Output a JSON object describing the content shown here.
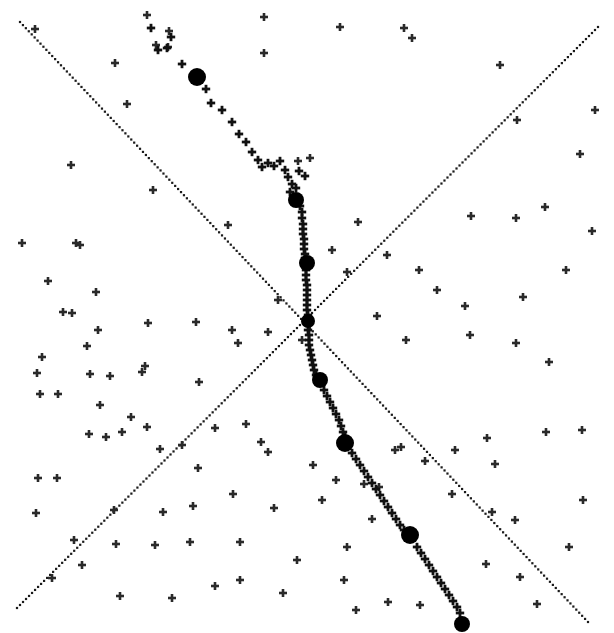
{
  "figure": {
    "title": "",
    "background_color": "#ffffff",
    "marker_color": "#111111",
    "line_color": "#1a1a1a",
    "width": 614,
    "height": 633
  },
  "chart_data": {
    "type": "scatter",
    "title": "",
    "xlabel": "",
    "ylabel": "",
    "xlim": [
      0,
      614
    ],
    "ylim": [
      0,
      633
    ],
    "grid": false,
    "legend": "none",
    "annotations": [],
    "tick_labels": {
      "x": [],
      "y": []
    },
    "origin": [
      308,
      321
    ],
    "series": [
      {
        "name": "crossing-line-nw-se",
        "type": "line",
        "style": "dotted",
        "marker": "square-dot",
        "x": [
          20,
          588
        ],
        "y": [
          22,
          622
        ]
      },
      {
        "name": "crossing-line-sw-ne",
        "type": "line",
        "style": "dotted",
        "marker": "square-dot",
        "x": [
          17,
          598
        ],
        "y": [
          608,
          27
        ]
      },
      {
        "name": "particle-track",
        "type": "scatter",
        "marker": "plus",
        "points": [
          [
            151,
            28
          ],
          [
            171,
            37
          ],
          [
            158,
            50
          ],
          [
            167,
            48
          ],
          [
            182,
            64
          ],
          [
            206,
            89
          ],
          [
            211,
            103
          ],
          [
            222,
            110
          ],
          [
            232,
            122
          ],
          [
            239,
            134
          ],
          [
            246,
            142
          ],
          [
            252,
            152
          ],
          [
            258,
            160
          ],
          [
            262,
            167
          ],
          [
            268,
            163
          ],
          [
            274,
            166
          ],
          [
            280,
            161
          ],
          [
            285,
            170
          ],
          [
            288,
            177
          ],
          [
            292,
            184
          ],
          [
            299,
            171
          ],
          [
            305,
            176
          ],
          [
            290,
            192
          ],
          [
            296,
            188
          ],
          [
            300,
            206
          ],
          [
            302,
            212
          ],
          [
            302,
            218
          ],
          [
            303,
            224
          ],
          [
            303,
            229
          ],
          [
            303,
            234
          ],
          [
            304,
            239
          ],
          [
            304,
            244
          ],
          [
            304,
            249
          ],
          [
            305,
            254
          ],
          [
            305,
            258
          ],
          [
            306,
            270
          ],
          [
            306,
            275
          ],
          [
            306,
            280
          ],
          [
            307,
            285
          ],
          [
            307,
            290
          ],
          [
            307,
            295
          ],
          [
            307,
            300
          ],
          [
            307,
            305
          ],
          [
            307,
            310
          ],
          [
            308,
            315
          ],
          [
            308,
            330
          ],
          [
            309,
            335
          ],
          [
            309,
            340
          ],
          [
            309,
            345
          ],
          [
            310,
            350
          ],
          [
            311,
            355
          ],
          [
            312,
            360
          ],
          [
            313,
            365
          ],
          [
            314,
            370
          ],
          [
            316,
            375
          ],
          [
            324,
            390
          ],
          [
            327,
            396
          ],
          [
            330,
            402
          ],
          [
            333,
            408
          ],
          [
            336,
            414
          ],
          [
            339,
            420
          ],
          [
            341,
            426
          ],
          [
            343,
            432
          ],
          [
            345,
            437
          ],
          [
            352,
            453
          ],
          [
            356,
            459
          ],
          [
            360,
            465
          ],
          [
            364,
            471
          ],
          [
            368,
            477
          ],
          [
            372,
            483
          ],
          [
            376,
            489
          ],
          [
            380,
            495
          ],
          [
            384,
            501
          ],
          [
            388,
            507
          ],
          [
            392,
            513
          ],
          [
            396,
            519
          ],
          [
            400,
            525
          ],
          [
            404,
            530
          ],
          [
            417,
            547
          ],
          [
            421,
            553
          ],
          [
            425,
            559
          ],
          [
            429,
            565
          ],
          [
            433,
            571
          ],
          [
            437,
            577
          ],
          [
            441,
            583
          ],
          [
            445,
            589
          ],
          [
            449,
            595
          ],
          [
            453,
            601
          ],
          [
            457,
            607
          ],
          [
            460,
            613
          ]
        ]
      },
      {
        "name": "track-bright-nodes",
        "type": "scatter",
        "marker": "filled-circle",
        "points": [
          [
            197,
            77,
            9
          ],
          [
            296,
            200,
            8
          ],
          [
            307,
            263,
            8
          ],
          [
            308,
            321,
            7
          ],
          [
            320,
            380,
            8
          ],
          [
            345,
            443,
            9
          ],
          [
            410,
            535,
            9
          ],
          [
            462,
            624,
            8
          ]
        ]
      },
      {
        "name": "background-field",
        "type": "scatter",
        "marker": "plus",
        "points": [
          [
            35,
            29
          ],
          [
            71,
            165
          ],
          [
            80,
            245
          ],
          [
            127,
            104
          ],
          [
            153,
            190
          ],
          [
            115,
            63
          ],
          [
            147,
            15
          ],
          [
            169,
            31
          ],
          [
            156,
            45
          ],
          [
            264,
            53
          ],
          [
            168,
            47
          ],
          [
            228,
            225
          ],
          [
            264,
            17
          ],
          [
            298,
            161
          ],
          [
            340,
            27
          ],
          [
            310,
            158
          ],
          [
            404,
            28
          ],
          [
            412,
            38
          ],
          [
            500,
            65
          ],
          [
            595,
            110
          ],
          [
            545,
            207
          ],
          [
            580,
            154
          ],
          [
            592,
            231
          ],
          [
            516,
            218
          ],
          [
            566,
            270
          ],
          [
            523,
            297
          ],
          [
            471,
            216
          ],
          [
            517,
            120
          ],
          [
            22,
            243
          ],
          [
            76,
            243
          ],
          [
            48,
            281
          ],
          [
            96,
            292
          ],
          [
            63,
            312
          ],
          [
            72,
            313
          ],
          [
            98,
            330
          ],
          [
            87,
            346
          ],
          [
            42,
            357
          ],
          [
            37,
            373
          ],
          [
            90,
            374
          ],
          [
            110,
            376
          ],
          [
            40,
            394
          ],
          [
            58,
            394
          ],
          [
            145,
            366
          ],
          [
            100,
            405
          ],
          [
            131,
            417
          ],
          [
            196,
            322
          ],
          [
            232,
            330
          ],
          [
            268,
            332
          ],
          [
            238,
            343
          ],
          [
            278,
            300
          ],
          [
            302,
            340
          ],
          [
            358,
            222
          ],
          [
            387,
            255
          ],
          [
            419,
            270
          ],
          [
            437,
            290
          ],
          [
            465,
            306
          ],
          [
            332,
            250
          ],
          [
            347,
            272
          ],
          [
            377,
            316
          ],
          [
            406,
            340
          ],
          [
            470,
            335
          ],
          [
            516,
            343
          ],
          [
            549,
            362
          ],
          [
            122,
            432
          ],
          [
            147,
            427
          ],
          [
            160,
            449
          ],
          [
            182,
            445
          ],
          [
            199,
            382
          ],
          [
            215,
            428
          ],
          [
            246,
            424
          ],
          [
            261,
            442
          ],
          [
            148,
            323
          ],
          [
            38,
            478
          ],
          [
            57,
            478
          ],
          [
            89,
            434
          ],
          [
            106,
            437
          ],
          [
            142,
            372
          ],
          [
            36,
            513
          ],
          [
            74,
            540
          ],
          [
            116,
            544
          ],
          [
            155,
            545
          ],
          [
            190,
            542
          ],
          [
            193,
            506
          ],
          [
            240,
            542
          ],
          [
            268,
            452
          ],
          [
            274,
            508
          ],
          [
            313,
            465
          ],
          [
            322,
            500
          ],
          [
            336,
            480
          ],
          [
            347,
            547
          ],
          [
            364,
            484
          ],
          [
            379,
            487
          ],
          [
            372,
            519
          ],
          [
            395,
            450
          ],
          [
            401,
            447
          ],
          [
            425,
            461
          ],
          [
            455,
            450
          ],
          [
            487,
            438
          ],
          [
            495,
            464
          ],
          [
            546,
            432
          ],
          [
            582,
            430
          ],
          [
            569,
            547
          ],
          [
            583,
            500
          ],
          [
            492,
            512
          ],
          [
            515,
            520
          ],
          [
            452,
            494
          ],
          [
            486,
            564
          ],
          [
            520,
            577
          ],
          [
            537,
            604
          ],
          [
            388,
            602
          ],
          [
            420,
            605
          ],
          [
            344,
            580
          ],
          [
            356,
            610
          ],
          [
            283,
            593
          ],
          [
            297,
            560
          ],
          [
            215,
            586
          ],
          [
            240,
            580
          ],
          [
            120,
            596
          ],
          [
            172,
            598
          ],
          [
            82,
            565
          ],
          [
            52,
            578
          ],
          [
            114,
            510
          ],
          [
            163,
            512
          ],
          [
            198,
            468
          ],
          [
            233,
            494
          ]
        ]
      }
    ]
  }
}
